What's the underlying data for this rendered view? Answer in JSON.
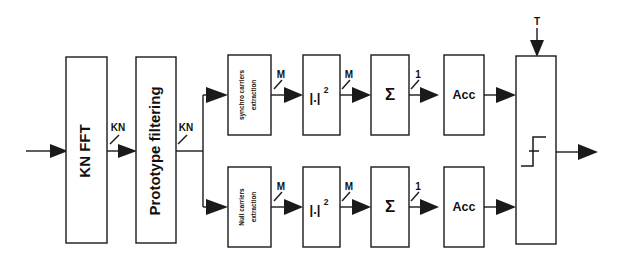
{
  "figure": {
    "kind": "block-diagram",
    "background_color": "#ffffff",
    "line_color": "#1a1a1a",
    "width": 621,
    "height": 262
  },
  "blocks": {
    "fft": {
      "label": "KN FFT",
      "orientation": "vertical"
    },
    "prototype": {
      "label": "Prototype filtering",
      "orientation": "vertical"
    },
    "synchro_extract": {
      "label_line1": "synchro carriers",
      "label_line2": "extraction",
      "orientation": "vertical"
    },
    "null_extract": {
      "label_line1": "Null carriers",
      "label_line2": "extraction",
      "orientation": "vertical"
    },
    "mag_sq_top": {
      "label": "|.|",
      "exponent": "2"
    },
    "mag_sq_bottom": {
      "label": "|.|",
      "exponent": "2"
    },
    "sum_top": {
      "label": "Σ"
    },
    "sum_bottom": {
      "label": "Σ"
    },
    "acc_top": {
      "label": "Acc"
    },
    "acc_bottom": {
      "label": "Acc"
    },
    "decision": {
      "label": "",
      "symbol": "step-threshold"
    }
  },
  "signal_labels": {
    "fft_out": "KN",
    "prototype_out": "KN",
    "synchro_extract_out": "M",
    "null_extract_out": "M",
    "magsq_top_out": "M",
    "magsq_bottom_out": "M",
    "sum_top_out": "1",
    "sum_bottom_out": "1",
    "threshold_input": "T"
  }
}
